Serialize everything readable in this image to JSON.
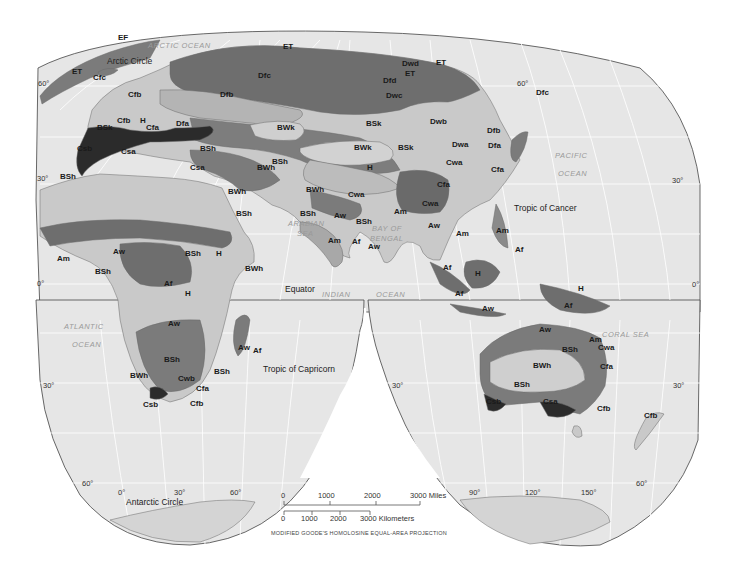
{
  "map": {
    "title": "World Climate Regions (Köppen)",
    "projection_note": "MODIFIED GOODE'S HOMOLOSINE EQUAL-AREA PROJECTION",
    "colors": {
      "ocean": "#e6e6e6",
      "land_light": "#c9c9c9",
      "land_mid": "#a8a8a8",
      "land_dark": "#7b7b7b",
      "land_darker": "#5e5e5e",
      "land_darkest": "#2b2b2b",
      "ice": "#d4d4d4",
      "grid": "#ffffff",
      "border": "#555555"
    },
    "oceans": [
      {
        "id": "arctic",
        "label": "ARCTIC  OCEAN"
      },
      {
        "id": "pacific1",
        "label": "PACIFIC"
      },
      {
        "id": "pacific2",
        "label": "OCEAN"
      },
      {
        "id": "atlantic1",
        "label": "ATLANTIC"
      },
      {
        "id": "atlantic2",
        "label": "OCEAN"
      },
      {
        "id": "arabian1",
        "label": "ARABIAN"
      },
      {
        "id": "arabian2",
        "label": "SEA"
      },
      {
        "id": "bengal1",
        "label": "BAY OF"
      },
      {
        "id": "bengal2",
        "label": "BENGAL"
      },
      {
        "id": "indian1",
        "label": "INDIAN"
      },
      {
        "id": "indian2",
        "label": "OCEAN"
      },
      {
        "id": "coral",
        "label": "CORAL SEA"
      }
    ],
    "reference_lines": [
      {
        "id": "arctic_circle",
        "label": "Arctic Circle"
      },
      {
        "id": "tropic_cancer",
        "label": "Tropic of Cancer"
      },
      {
        "id": "equator",
        "label": "Equator"
      },
      {
        "id": "tropic_capricorn",
        "label": "Tropic of Capricorn"
      },
      {
        "id": "antarctic_circle",
        "label": "Antarctic Circle"
      }
    ],
    "degree_labels": {
      "n60_left": "60°",
      "n60_right": "60°",
      "n30_left": "30°",
      "n30_right": "30°",
      "eq_left": "0°",
      "eq_right": "0°",
      "s30_left": "30°",
      "s30_mid": "30°",
      "s30_right": "30°",
      "s60_left": "60°",
      "s60_right": "60°",
      "lon_0": "0°",
      "lon_30": "30°",
      "lon_60": "60°",
      "lon_90": "90°",
      "lon_120": "120°",
      "lon_150": "150°"
    },
    "climate_labels": {
      "europe": [
        "EF",
        "ET",
        "Cfc",
        "Cfb",
        "H",
        "Cfb",
        "BSk",
        "Cfa",
        "Dfa",
        "Csb",
        "Csa",
        "BSh",
        "Csa",
        "BSh",
        "Dfb"
      ],
      "asia": [
        "ET",
        "Dfc",
        "Dwd",
        "ET",
        "ET",
        "Dfd",
        "Dwc",
        "BWk",
        "BSk",
        "Dwb",
        "BSh",
        "BWh",
        "BWk",
        "BSk",
        "H",
        "Dwa",
        "Dfb",
        "Dfa",
        "Cwa",
        "Cfa",
        "Dfc",
        "BWh",
        "Cwa",
        "Cfa",
        "Cwa",
        "BSh",
        "Aw",
        "BSh",
        "Am",
        "Aw",
        "Af",
        "Am",
        "Aw",
        "Am",
        "Am",
        "Af",
        "Af",
        "H",
        "Af",
        "Aw",
        "H",
        "Af"
      ],
      "africa": [
        "BWh",
        "BSh",
        "Am",
        "Aw",
        "BSh",
        "BSh",
        "H",
        "BWh",
        "Af",
        "H",
        "Aw",
        "BSh",
        "Aw",
        "Af",
        "BSh",
        "BWh",
        "Cwb",
        "Cfa",
        "Csb",
        "Cfb"
      ],
      "australia": [
        "Aw",
        "Am",
        "Cwa",
        "BSh",
        "BWh",
        "Cfa",
        "BSh",
        "Csb",
        "Csa",
        "Cfb",
        "Cfb"
      ]
    },
    "scale": {
      "miles_ticks": [
        "0",
        "1000",
        "2000",
        "3000 Miles"
      ],
      "km_ticks": [
        "0",
        "1000",
        "2000",
        "3000 Kilometers"
      ]
    }
  }
}
